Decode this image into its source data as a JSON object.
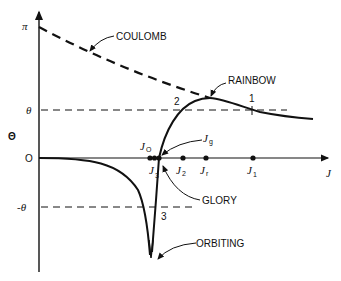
{
  "diagram": {
    "y_axis_label": "Θ",
    "x_axis_label": "J",
    "y_ticks": {
      "pi": "π",
      "theta": "θ",
      "zero": "O",
      "neg_theta": "-θ"
    },
    "curve_labels": {
      "coulomb": "COULOMB",
      "rainbow": "RAINBOW",
      "glory": "GLORY",
      "orbiting": "ORBITING"
    },
    "branch_numbers": {
      "one": "1",
      "two": "2",
      "three": "3"
    },
    "j_points": {
      "j0": "J",
      "j0_sub": "O",
      "j3": "J",
      "j3_sub": "3",
      "jg": "J",
      "jg_sub": "g",
      "j2": "J",
      "j2_sub": "2",
      "jr": "J",
      "jr_sub": "r",
      "j1": "J",
      "j1_sub": "1"
    },
    "colors": {
      "ink": "#111111",
      "background": "#ffffff"
    }
  }
}
